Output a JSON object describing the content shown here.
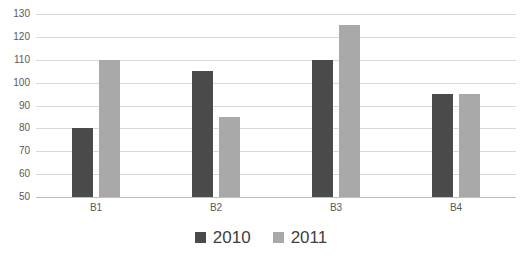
{
  "chart_data": {
    "type": "bar",
    "title": "",
    "xlabel": "",
    "ylabel": "",
    "categories": [
      "B1",
      "B2",
      "B3",
      "B4"
    ],
    "series": [
      {
        "name": "2010",
        "values": [
          80,
          105,
          110,
          95
        ],
        "color": "#4a4a4a"
      },
      {
        "name": "2011",
        "values": [
          110,
          85,
          125,
          95
        ],
        "color": "#a9a9a9"
      }
    ],
    "ylim": [
      50,
      130
    ],
    "ytick_step": 10,
    "yticks": [
      130,
      120,
      110,
      100,
      90,
      80,
      70,
      60,
      50
    ],
    "grid": true,
    "legend_position": "bottom"
  },
  "style": {
    "background_color": "#ffffff",
    "gridline_color": "#d9d9d9",
    "axis_line_color": "#bfbfbf",
    "tick_label_color": "#595959",
    "legend_text_color": "#404040"
  }
}
